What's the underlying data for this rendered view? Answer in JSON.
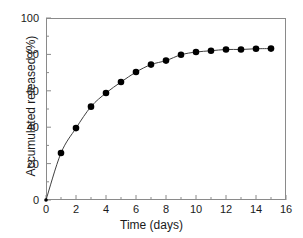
{
  "chart_data": {
    "type": "line",
    "title": "",
    "subtitle": "",
    "xlabel": "Time (days)",
    "ylabel": "Accumulated released (%)",
    "xlim": [
      0,
      16
    ],
    "ylim": [
      0,
      100
    ],
    "xticks": [
      0,
      2,
      4,
      6,
      8,
      10,
      12,
      14,
      16
    ],
    "yticks": [
      0,
      20,
      40,
      60,
      80,
      100
    ],
    "xtick_labels": [
      "0",
      "2",
      "4",
      "6",
      "8",
      "10",
      "12",
      "14",
      "16"
    ],
    "ytick_labels": [
      "0",
      "20",
      "40",
      "60",
      "80",
      "100"
    ],
    "x_minor_tick_step": 1,
    "y_minor_tick_step": 10,
    "grid": false,
    "legend": null,
    "marker": "filled-circle",
    "marker_color": "#000000",
    "line_color": "#404040",
    "axis_color": "#8a8a8a",
    "series": [
      {
        "name": "Accumulated released",
        "x": [
          0,
          1,
          2,
          3,
          4,
          5,
          6,
          7,
          8,
          9,
          10,
          11,
          12,
          13,
          14,
          15
        ],
        "values": [
          0,
          25.8,
          39.5,
          51.3,
          58.8,
          64.8,
          70.3,
          74.4,
          76.6,
          79.8,
          81.3,
          82.0,
          82.7,
          82.7,
          83.1,
          83.2
        ]
      }
    ]
  }
}
